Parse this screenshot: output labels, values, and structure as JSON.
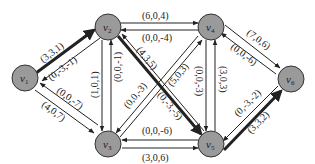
{
  "diagram": {
    "type": "flow-network",
    "colors": {
      "background": "#ffffff",
      "node_fill": "#9a9a9a",
      "node_stroke": "#333333",
      "edge": "#222222"
    },
    "nodes": [
      {
        "id": "v1",
        "label": "v",
        "sub": "1"
      },
      {
        "id": "v2",
        "label": "v",
        "sub": "2"
      },
      {
        "id": "v3",
        "label": "v",
        "sub": "3"
      },
      {
        "id": "v4",
        "label": "v",
        "sub": "4"
      },
      {
        "id": "v5",
        "label": "v",
        "sub": "5"
      },
      {
        "id": "v6",
        "label": "v",
        "sub": "6"
      }
    ],
    "edges": [
      {
        "from": "v1",
        "to": "v2",
        "label": "(3,3,1)",
        "thick": true
      },
      {
        "from": "v2",
        "to": "v1",
        "label": "(0,-3,-1)",
        "thick": false
      },
      {
        "from": "v1",
        "to": "v3",
        "label": "(4,0,7)",
        "thick": false
      },
      {
        "from": "v3",
        "to": "v1",
        "label": "(0,0,-7)",
        "thick": false
      },
      {
        "from": "v2",
        "to": "v4",
        "label": "(6,0,4)",
        "thick": false
      },
      {
        "from": "v4",
        "to": "v2",
        "label": "(0,0,-4)",
        "thick": false
      },
      {
        "from": "v2",
        "to": "v3",
        "label": "(1,0,1)",
        "thick": false
      },
      {
        "from": "v3",
        "to": "v2",
        "label": "(0,0,-1)",
        "thick": false
      },
      {
        "from": "v2",
        "to": "v5",
        "label": "(4,3,5)",
        "thick": true
      },
      {
        "from": "v5",
        "to": "v2",
        "label": "(0,-3,-5)",
        "thick": false
      },
      {
        "from": "v3",
        "to": "v4",
        "label": "(5,0,3)",
        "thick": false
      },
      {
        "from": "v4",
        "to": "v3",
        "label": "(0,0,-3)",
        "thick": false
      },
      {
        "from": "v4",
        "to": "v5",
        "label": "(0,0,-3)",
        "thick": false
      },
      {
        "from": "v5",
        "to": "v4",
        "label": "(3,0,3)",
        "thick": false
      },
      {
        "from": "v3",
        "to": "v5",
        "label": "(3,0,6)",
        "thick": false
      },
      {
        "from": "v5",
        "to": "v3",
        "label": "(0,0,-6)",
        "thick": false
      },
      {
        "from": "v4",
        "to": "v6",
        "label": "(7,0,6)",
        "thick": false
      },
      {
        "from": "v6",
        "to": "v4",
        "label": "(0,0,-6)",
        "thick": false
      },
      {
        "from": "v5",
        "to": "v6",
        "label": "(3,3,2)",
        "thick": true
      },
      {
        "from": "v6",
        "to": "v5",
        "label": "(0,-3,-2)",
        "thick": false
      }
    ]
  }
}
